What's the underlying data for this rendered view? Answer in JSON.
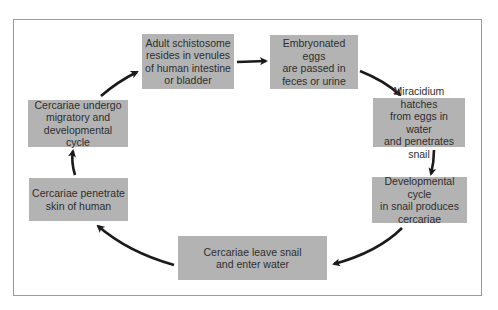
{
  "diagram": {
    "type": "cycle",
    "colors": {
      "box_fill": "#b3b3b3",
      "box_text": "#2e2e2e",
      "arrow": "#1a1a1a",
      "frame_border": "#9a9a9a",
      "background": "#ffffff"
    },
    "steps": [
      {
        "id": "adult",
        "label": "Adult schistosome\nresides in venules\nof human intestine\nor bladder"
      },
      {
        "id": "eggs",
        "label": "Embryonated eggs\nare passed in\nfeces or urine"
      },
      {
        "id": "miracidium",
        "label": "Miracidium hatches\nfrom eggs in water\nand penetrates snail"
      },
      {
        "id": "snail-cycle",
        "label": "Developmental cycle\nin snail produces\ncercariae"
      },
      {
        "id": "leave-snail",
        "label": "Cercariae leave snail\nand enter water"
      },
      {
        "id": "penetrate",
        "label": "Cercariae penetrate\nskin of human"
      },
      {
        "id": "migratory",
        "label": "Cercariae undergo\nmigratory and\ndevelopmental cycle"
      }
    ],
    "edges": [
      {
        "from": "adult",
        "to": "eggs"
      },
      {
        "from": "eggs",
        "to": "miracidium"
      },
      {
        "from": "miracidium",
        "to": "snail-cycle"
      },
      {
        "from": "snail-cycle",
        "to": "leave-snail"
      },
      {
        "from": "leave-snail",
        "to": "penetrate"
      },
      {
        "from": "penetrate",
        "to": "migratory"
      },
      {
        "from": "migratory",
        "to": "adult"
      }
    ]
  }
}
